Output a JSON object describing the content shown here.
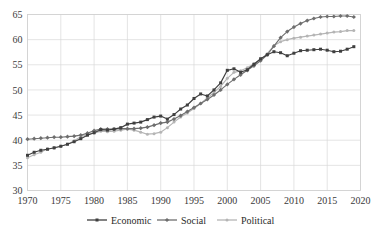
{
  "chart_data": {
    "type": "line",
    "title": "",
    "subtitle": "",
    "xlabel": "",
    "ylabel": "",
    "xlim": [
      1970,
      2020
    ],
    "ylim": [
      30,
      65
    ],
    "ytick_step": 5,
    "xtick_step": 5,
    "grid": true,
    "grid_axis": "both",
    "legend_position": "bottom",
    "xticks": [
      1970,
      1975,
      1980,
      1985,
      1990,
      1995,
      2000,
      2005,
      2010,
      2015,
      2020
    ],
    "yticks": [
      30,
      35,
      40,
      45,
      50,
      55,
      60,
      65
    ],
    "x": [
      1970,
      1971,
      1972,
      1973,
      1974,
      1975,
      1976,
      1977,
      1978,
      1979,
      1980,
      1981,
      1982,
      1983,
      1984,
      1985,
      1986,
      1987,
      1988,
      1989,
      1990,
      1991,
      1992,
      1993,
      1994,
      1995,
      1996,
      1997,
      1998,
      1999,
      2000,
      2001,
      2002,
      2003,
      2004,
      2005,
      2006,
      2007,
      2008,
      2009,
      2010,
      2011,
      2012,
      2013,
      2014,
      2015,
      2016,
      2017,
      2018,
      2019
    ],
    "series": [
      {
        "name": "Economic",
        "color": "#3f3f3f",
        "marker": "square",
        "values": [
          37.0,
          37.6,
          38.0,
          38.2,
          38.5,
          38.8,
          39.2,
          39.7,
          40.3,
          41.0,
          41.5,
          42.1,
          42.0,
          42.2,
          42.5,
          43.2,
          43.4,
          43.6,
          44.1,
          44.6,
          44.8,
          44.2,
          45.1,
          46.2,
          47.0,
          48.3,
          49.2,
          48.8,
          50.0,
          51.4,
          53.9,
          54.2,
          53.5,
          54.0,
          55.1,
          56.2,
          57.0,
          57.6,
          57.4,
          56.8,
          57.3,
          57.8,
          57.9,
          58.0,
          58.1,
          57.9,
          57.6,
          57.7,
          58.1,
          58.6
        ]
      },
      {
        "name": "Social",
        "color": "#6e6e6e",
        "marker": "diamond",
        "values": [
          40.2,
          40.3,
          40.4,
          40.5,
          40.6,
          40.6,
          40.7,
          40.8,
          41.0,
          41.4,
          41.9,
          42.2,
          42.2,
          42.2,
          42.3,
          42.3,
          42.3,
          42.4,
          42.6,
          43.0,
          43.4,
          43.6,
          44.2,
          44.9,
          45.7,
          46.5,
          47.3,
          48.1,
          49.0,
          50.0,
          51.1,
          52.1,
          53.0,
          53.9,
          54.8,
          55.8,
          57.0,
          58.7,
          60.4,
          61.6,
          62.5,
          63.2,
          63.8,
          64.2,
          64.5,
          64.6,
          64.6,
          64.7,
          64.7,
          64.5
        ]
      },
      {
        "name": "Political",
        "color": "#b5b5b5",
        "marker": "circle",
        "values": [
          36.5,
          37.1,
          37.6,
          38.3,
          38.4,
          38.8,
          39.2,
          39.9,
          40.7,
          41.2,
          41.4,
          41.8,
          41.7,
          41.8,
          42.0,
          42.2,
          42.0,
          41.6,
          41.2,
          41.3,
          41.6,
          42.5,
          43.6,
          44.6,
          45.4,
          46.3,
          47.3,
          48.4,
          49.5,
          50.7,
          52.3,
          53.5,
          53.8,
          54.4,
          55.2,
          56.0,
          57.2,
          58.8,
          59.6,
          60.0,
          60.3,
          60.5,
          60.7,
          60.9,
          61.1,
          61.3,
          61.5,
          61.6,
          61.8,
          61.8
        ]
      }
    ]
  },
  "legend": {
    "items": [
      {
        "label": "Economic"
      },
      {
        "label": "Social"
      },
      {
        "label": "Political"
      }
    ]
  }
}
